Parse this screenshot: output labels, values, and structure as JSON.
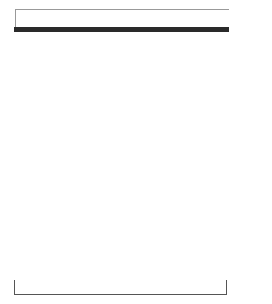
{
  "chart": {
    "columns": 12,
    "colors": {
      "filled": "#4a4a4a",
      "empty": "#ffffff",
      "border": "#2a2a2a"
    },
    "top_row": [
      0,
      0,
      0,
      0,
      0,
      0,
      0,
      0,
      0,
      0,
      0,
      0
    ],
    "rows": [
      {
        "row": 13,
        "cells": [
          1,
          1,
          1,
          1,
          0,
          0,
          0,
          0,
          0,
          1,
          1,
          1
        ]
      },
      {
        "row": 12,
        "cells": [
          0,
          0,
          0,
          1,
          0,
          0,
          0,
          0,
          0,
          1,
          0,
          0
        ]
      },
      {
        "row": 11,
        "cells": [
          1,
          0,
          0,
          1,
          0,
          0,
          1,
          1,
          1,
          1,
          1,
          1
        ]
      },
      {
        "row": 10,
        "cells": [
          1,
          0,
          0,
          1,
          0,
          0,
          1,
          1,
          1,
          1,
          1,
          1
        ]
      },
      {
        "row": 9,
        "cells": [
          0,
          0,
          1,
          0,
          1,
          0,
          0,
          1,
          1,
          1,
          1,
          1
        ]
      },
      {
        "row": 8,
        "cells": [
          0,
          0,
          1,
          0,
          1,
          0,
          0,
          1,
          1,
          1,
          1,
          1
        ]
      },
      {
        "row": 7,
        "cells": [
          0,
          1,
          0,
          0,
          0,
          1,
          0,
          0,
          1,
          1,
          1,
          0
        ]
      },
      {
        "row": 6,
        "cells": [
          0,
          1,
          0,
          0,
          0,
          1,
          0,
          0,
          1,
          1,
          1,
          0
        ]
      },
      {
        "row": 5,
        "cells": [
          1,
          0,
          0,
          0,
          0,
          0,
          1,
          0,
          0,
          1,
          0,
          0
        ]
      },
      {
        "row": 4,
        "cells": [
          1,
          1,
          1,
          1,
          1,
          1,
          1,
          0,
          0,
          1,
          0,
          0
        ]
      },
      {
        "row": 3,
        "cells": [
          0,
          0,
          0,
          1,
          0,
          0,
          0,
          0,
          0,
          1,
          0,
          0
        ]
      },
      {
        "row": 2,
        "cells": [
          0,
          0,
          0,
          1,
          1,
          1,
          1,
          1,
          1,
          1,
          0,
          0
        ]
      },
      {
        "row": 1,
        "cells": [
          0,
          0,
          0,
          0,
          0,
          0,
          0,
          0,
          0,
          0,
          0,
          0
        ]
      }
    ]
  },
  "row_labels": [
    {
      "text": "13",
      "row": 13
    },
    {
      "text": "11",
      "row": 11
    },
    {
      "text": "9",
      "row": 9
    },
    {
      "text": "7",
      "row": 7
    },
    {
      "text": "5",
      "row": 5
    },
    {
      "text": "3",
      "row": 3
    },
    {
      "text": "1",
      "row": 1
    }
  ]
}
